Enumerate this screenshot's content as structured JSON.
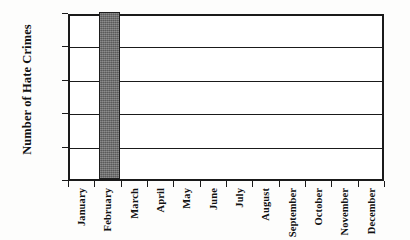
{
  "chart_data": {
    "type": "bar",
    "title": "",
    "xlabel": "",
    "ylabel": "Number of Hate Crimes",
    "categories": [
      "January",
      "February",
      "March",
      "April",
      "May",
      "June",
      "July",
      "August",
      "September",
      "October",
      "November",
      "December"
    ],
    "values": [
      0,
      10,
      0,
      0,
      0,
      0,
      0,
      0,
      0,
      0,
      0,
      0
    ],
    "ylim": [
      0,
      10
    ],
    "yticks": [
      0,
      2,
      4,
      6,
      8,
      10
    ],
    "ytick_labels": [
      "0",
      "2",
      "4",
      "6",
      "8",
      "10"
    ],
    "grid": "horizontal",
    "legend": "none",
    "series": [
      {
        "name": "Hate Crimes",
        "values": [
          0,
          10,
          0,
          0,
          0,
          0,
          0,
          0,
          0,
          0,
          0,
          0
        ],
        "color": "#6c6c6c"
      }
    ]
  },
  "axes": {
    "y_title": "Number of Hate Crimes",
    "frame_color": "#1a1a1a",
    "bar_fill_color": "#6c6c6c",
    "background_color": "#ffffff"
  }
}
